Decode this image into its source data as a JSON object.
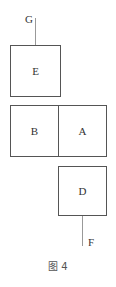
{
  "diagram": {
    "boxes": [
      {
        "id": "E",
        "label": "E"
      },
      {
        "id": "B",
        "label": "B"
      },
      {
        "id": "A",
        "label": "A"
      },
      {
        "id": "D",
        "label": "D"
      }
    ],
    "terminals": [
      {
        "id": "G",
        "label": "G",
        "attached_to": "E",
        "side": "top"
      },
      {
        "id": "F",
        "label": "F",
        "attached_to": "D",
        "side": "bottom"
      }
    ],
    "caption": "图 4"
  }
}
